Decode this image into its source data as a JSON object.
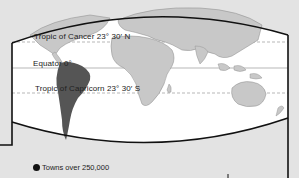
{
  "map": {
    "lines": {
      "tropic_cancer": "Tropic of Cancer 23° 30′ N",
      "equator": "Equator 0°",
      "tropic_capricorn": "Tropic of Capricorn 23° 30′ S"
    },
    "highlighted_region": "South America",
    "colors": {
      "land": "#c8c8c8",
      "highlight": "#555555",
      "ocean": "#ffffff",
      "outside": "#e3e3e3",
      "border": "#111111"
    }
  },
  "legend": {
    "items": [
      {
        "symbol": "filled-circle",
        "label": "Towns over 250,000"
      }
    ]
  }
}
